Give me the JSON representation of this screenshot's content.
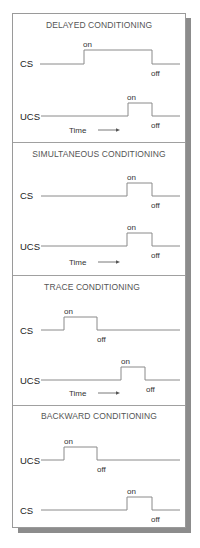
{
  "colors": {
    "box_fill": "#ffffff",
    "box_border": "#9a9a9a",
    "shadow": "#8c8c8c",
    "divider": "#a0a0a0",
    "wave": "#8a8a8a"
  },
  "panels": [
    {
      "title": "DELAYED CONDITIONING",
      "signals": [
        {
          "label": "CS",
          "on_label": "on",
          "off_label": "off"
        },
        {
          "label": "UCS",
          "on_label": "on",
          "off_label": "off"
        }
      ],
      "time_label": "Time"
    },
    {
      "title": "SIMULTANEOUS CONDITIONING",
      "signals": [
        {
          "label": "CS",
          "on_label": "on",
          "off_label": "off"
        },
        {
          "label": "UCS",
          "on_label": "on",
          "off_label": "off"
        }
      ],
      "time_label": "Time"
    },
    {
      "title": "TRACE CONDITIONING",
      "signals": [
        {
          "label": "CS",
          "on_label": "on",
          "off_label": "off"
        },
        {
          "label": "UCS",
          "on_label": "on",
          "off_label": "off"
        }
      ],
      "time_label": "Time"
    },
    {
      "title": "BACKWARD CONDITIONING",
      "signals": [
        {
          "label": "UCS",
          "on_label": "on",
          "off_label": "off"
        },
        {
          "label": "CS",
          "on_label": "on",
          "off_label": "off"
        }
      ]
    }
  ]
}
